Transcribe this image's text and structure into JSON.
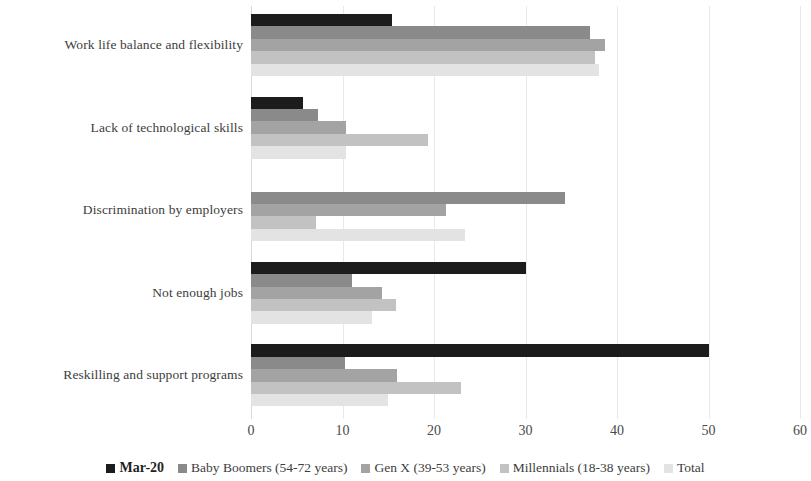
{
  "chart_data": {
    "type": "bar",
    "orientation": "horizontal",
    "title": "",
    "xlabel": "",
    "ylabel": "",
    "xlim": [
      0,
      60
    ],
    "xticks": [
      0,
      10,
      20,
      30,
      40,
      50,
      60
    ],
    "grid": true,
    "legend_position": "bottom",
    "categories": [
      "Work life balance and flexibility",
      "Lack of technological skills",
      "Discrimination by employers",
      "Not enough jobs",
      "Reskilling and support programs"
    ],
    "series": [
      {
        "name": "Mar-20",
        "color": "#1c1c1c",
        "values": [
          15.4,
          5.7,
          0,
          30,
          50
        ]
      },
      {
        "name": "Baby Boomers (54-72 years)",
        "color": "#8a8a8a",
        "values": [
          37,
          7.3,
          34.3,
          11,
          10.3
        ]
      },
      {
        "name": "Gen X (39-53 years)",
        "color": "#a3a3a3",
        "values": [
          38.7,
          10.4,
          21.3,
          14.3,
          16
        ]
      },
      {
        "name": "Millennials (18-38 years)",
        "color": "#c2c2c2",
        "values": [
          37.6,
          19.3,
          7.1,
          15.8,
          23
        ]
      },
      {
        "name": "Total",
        "color": "#e3e3e3",
        "values": [
          38,
          10.4,
          23.4,
          13.2,
          15
        ]
      }
    ]
  },
  "axis": {
    "tick_labels": [
      "0",
      "10",
      "20",
      "30",
      "40",
      "50",
      "60"
    ]
  },
  "legend": {
    "items": [
      {
        "label": "Mar-20",
        "color": "#1c1c1c"
      },
      {
        "label": "Baby Boomers (54-72 years)",
        "color": "#8a8a8a"
      },
      {
        "label": "Gen X (39-53 years)",
        "color": "#a3a3a3"
      },
      {
        "label": "Millennials (18-38 years)",
        "color": "#c2c2c2"
      },
      {
        "label": "Total",
        "color": "#e3e3e3"
      }
    ]
  }
}
